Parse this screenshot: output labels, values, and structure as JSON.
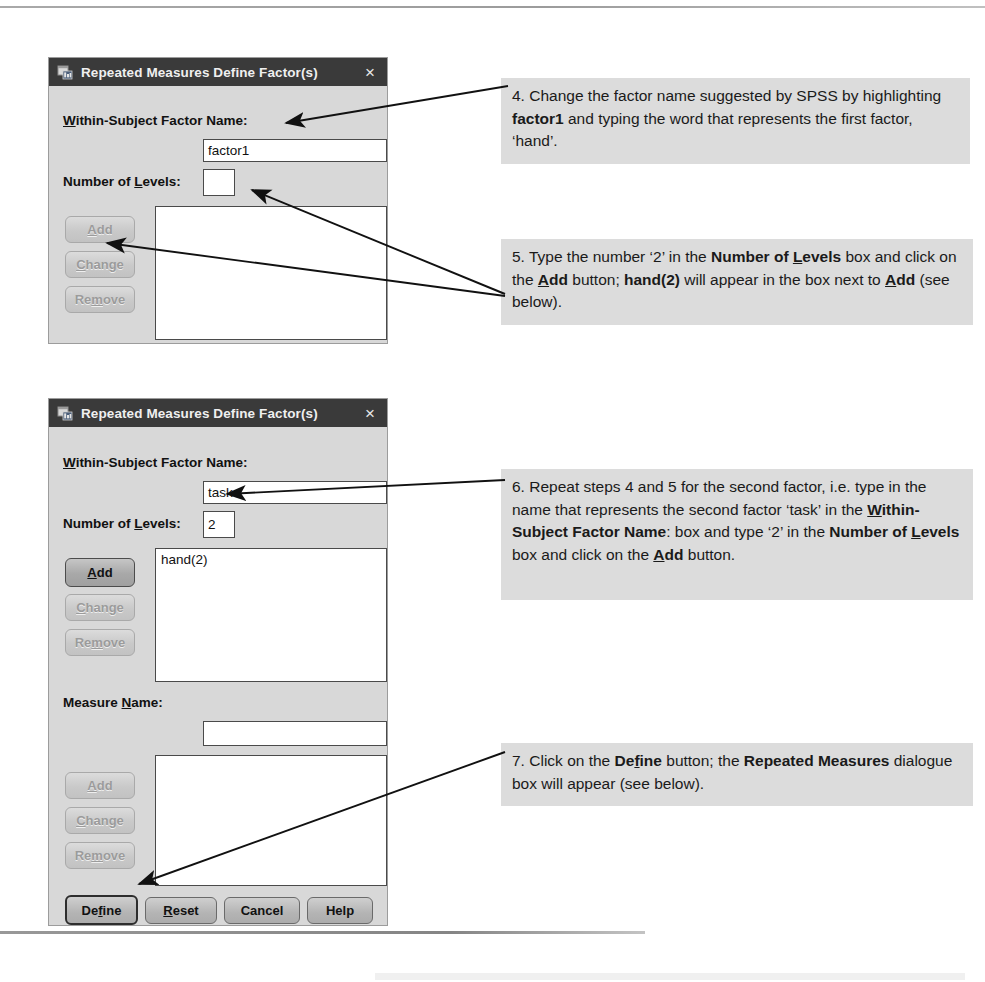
{
  "dialogs": [
    {
      "id": "dialog-1",
      "title": "Repeated Measures Define Factor(s)",
      "icon": "spss-window-icon",
      "close_label": "×",
      "within_subject_label_pre": "W",
      "within_subject_label_post": "ithin-Subject Factor Name:",
      "factor_name_value": "factor1",
      "levels_label_pre": "Number of ",
      "levels_label_mid": "L",
      "levels_label_post": "evels:",
      "levels_value": "",
      "buttons": [
        {
          "name": "add-button",
          "label_pre": "A",
          "label_post": "dd",
          "state": "disabled"
        },
        {
          "name": "change-button",
          "label_pre": "C",
          "label_post": "hange",
          "state": "disabled"
        },
        {
          "name": "remove-button",
          "label_pre": "Re",
          "label_mid": "m",
          "label_post": "ove",
          "state": "disabled"
        }
      ],
      "factor_list_items": []
    },
    {
      "id": "dialog-2",
      "title": "Repeated Measures Define Factor(s)",
      "icon": "spss-window-icon",
      "close_label": "×",
      "within_subject_label_pre": "W",
      "within_subject_label_post": "ithin-Subject Factor Name:",
      "factor_name_value": "task",
      "levels_label_pre": "Number of ",
      "levels_label_mid": "L",
      "levels_label_post": "evels:",
      "levels_value": "2",
      "factor_list_items": [
        "hand(2)"
      ],
      "measure_label_pre": "Measure ",
      "measure_label_mid": "N",
      "measure_label_post": "ame:",
      "measure_name_value": "",
      "measure_list_items": [],
      "factor_buttons": [
        {
          "name": "add-button",
          "label_pre": "A",
          "label_post": "dd",
          "state": "enabled"
        },
        {
          "name": "change-button",
          "label_pre": "C",
          "label_post": "hange",
          "state": "disabled"
        },
        {
          "name": "remove-button",
          "label_pre": "Re",
          "label_mid": "m",
          "label_post": "ove",
          "state": "disabled"
        }
      ],
      "measure_buttons": [
        {
          "name": "measure-add-button",
          "label_pre": "A",
          "label_post": "dd",
          "state": "disabled"
        },
        {
          "name": "measure-change-button",
          "label_pre": "C",
          "label_post": "hange",
          "state": "disabled"
        },
        {
          "name": "measure-remove-button",
          "label_pre": "Re",
          "label_mid": "m",
          "label_post": "ove",
          "state": "disabled"
        }
      ],
      "action_buttons": [
        {
          "name": "define-button",
          "label_pre": "De",
          "label_mid": "f",
          "label_post": "ine",
          "state": "default"
        },
        {
          "name": "reset-button",
          "label_pre": "",
          "label_mid": "R",
          "label_post": "eset",
          "state": "plain"
        },
        {
          "name": "cancel-button",
          "label_pre": "Cancel",
          "label_mid": "",
          "label_post": "",
          "state": "plain"
        },
        {
          "name": "help-button",
          "label_pre": "Help",
          "label_mid": "",
          "label_post": "",
          "state": "plain"
        }
      ]
    }
  ],
  "notes": {
    "step4": {
      "number": "4.",
      "segments": [
        {
          "t": " Change the factor name suggested by SPSS by highlighting ",
          "b": false
        },
        {
          "t": "factor1",
          "b": true
        },
        {
          "t": " and typing the word that represents the first factor, ‘hand’.",
          "b": false
        }
      ]
    },
    "step5": {
      "number": "5.",
      "segments": [
        {
          "t": " Type the number ‘2’ in the ",
          "b": false
        },
        {
          "t": "Number of ",
          "b": true
        },
        {
          "t": "L",
          "b": true,
          "u": true
        },
        {
          "t": "evels",
          "b": true
        },
        {
          "t": " box and click on the ",
          "b": false
        },
        {
          "t": "A",
          "b": true,
          "u": true
        },
        {
          "t": "dd",
          "b": true
        },
        {
          "t": " button; ",
          "b": false
        },
        {
          "t": "hand(2)",
          "b": true
        },
        {
          "t": " will appear in the box next to ",
          "b": false
        },
        {
          "t": "A",
          "b": true,
          "u": true
        },
        {
          "t": "dd",
          "b": true
        },
        {
          "t": " (see below).",
          "b": false
        }
      ]
    },
    "step6": {
      "number": "6.",
      "segments": [
        {
          "t": " Repeat steps 4 and 5 for the second factor, i.e. type in the name that represents the second factor ‘task’ in the ",
          "b": false
        },
        {
          "t": "W",
          "b": true,
          "u": true
        },
        {
          "t": "ithin-Subject Factor Name",
          "b": true
        },
        {
          "t": ": box and type ‘2’ in the ",
          "b": false
        },
        {
          "t": "Number of ",
          "b": true
        },
        {
          "t": "L",
          "b": true,
          "u": true
        },
        {
          "t": "evels",
          "b": true
        },
        {
          "t": " box and click on the ",
          "b": false
        },
        {
          "t": "A",
          "b": true,
          "u": true
        },
        {
          "t": "dd",
          "b": true
        },
        {
          "t": " button.",
          "b": false
        }
      ]
    },
    "step7": {
      "number": "7.",
      "segments": [
        {
          "t": " Click on the ",
          "b": false
        },
        {
          "t": "De",
          "b": true
        },
        {
          "t": "f",
          "b": true,
          "u": true
        },
        {
          "t": "ine",
          "b": true
        },
        {
          "t": " button; the ",
          "b": false
        },
        {
          "t": "Repeated Measures",
          "b": true
        },
        {
          "t": " dialogue box will appear (see below).",
          "b": false
        }
      ]
    }
  },
  "colors": {
    "titlebar": "#3a3a3a",
    "dialog_face": "#d8d8d8",
    "note_bg": "#dcdcdc",
    "field_bg": "#ffffff",
    "text": "#111111"
  }
}
